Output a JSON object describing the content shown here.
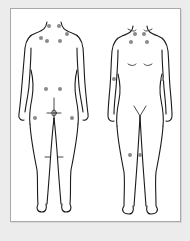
{
  "diagram": {
    "figures": [
      {
        "id": "back",
        "label": "Back view"
      },
      {
        "id": "front",
        "label": "Front view"
      }
    ],
    "colors": {
      "background": "#ececec",
      "frame": "#ffffff",
      "frame_border": "#a9a9a9",
      "outline": "#1a1a1a",
      "point": "#8a8a8a"
    },
    "points": {
      "back": [
        {
          "name": "occiput-left",
          "x": 49,
          "y": 26
        },
        {
          "name": "occiput-right",
          "x": 59,
          "y": 26
        },
        {
          "name": "trapezius-left",
          "x": 41,
          "y": 38
        },
        {
          "name": "trapezius-right",
          "x": 67,
          "y": 34
        },
        {
          "name": "supraspinatus-left",
          "x": 47,
          "y": 41
        },
        {
          "name": "supraspinatus-right",
          "x": 60,
          "y": 41
        },
        {
          "name": "gluteal-left",
          "x": 46,
          "y": 89
        },
        {
          "name": "gluteal-right",
          "x": 60,
          "y": 89
        },
        {
          "name": "trochanter-left",
          "x": 35,
          "y": 118
        },
        {
          "name": "trochanter-right",
          "x": 72,
          "y": 118
        }
      ],
      "front": [
        {
          "name": "low-cervical-left",
          "x": 135,
          "y": 34
        },
        {
          "name": "low-cervical-right",
          "x": 144,
          "y": 34
        },
        {
          "name": "second-rib-left",
          "x": 131,
          "y": 42
        },
        {
          "name": "second-rib-right",
          "x": 147,
          "y": 42
        },
        {
          "name": "lateral-epicondyle-left",
          "x": 114,
          "y": 79
        },
        {
          "name": "lateral-epicondyle-right",
          "x": 162,
          "y": 79
        },
        {
          "name": "knee-left",
          "x": 130,
          "y": 155
        },
        {
          "name": "knee-right",
          "x": 140,
          "y": 155
        }
      ]
    }
  }
}
